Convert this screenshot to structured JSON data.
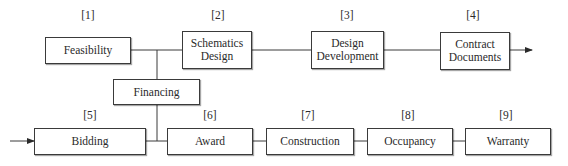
{
  "diagram": {
    "top_row": [
      {
        "num": "[1]",
        "label": "Feasibility"
      },
      {
        "num": "[2]",
        "label": "Schematics Design",
        "l1": "Schematics",
        "l2": "Design"
      },
      {
        "num": "[3]",
        "label": "Design Development",
        "l1": "Design",
        "l2": "Development"
      },
      {
        "num": "[4]",
        "label": "Contract Documents",
        "l1": "Contract",
        "l2": "Documents"
      }
    ],
    "middle": {
      "label": "Financing"
    },
    "bottom_row": [
      {
        "num": "[5]",
        "label": "Bidding"
      },
      {
        "num": "[6]",
        "label": "Award"
      },
      {
        "num": "[7]",
        "label": "Construction"
      },
      {
        "num": "[8]",
        "label": "Occupancy"
      },
      {
        "num": "[9]",
        "label": "Warranty"
      }
    ],
    "colors": {
      "line": "#3a3a3a",
      "box_border": "#3a3a3a",
      "background": "#ffffff"
    }
  }
}
